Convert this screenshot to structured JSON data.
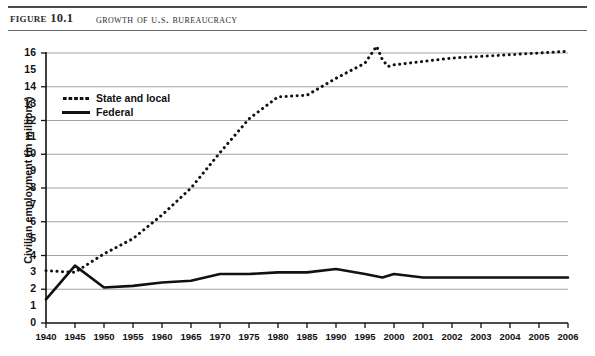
{
  "header": {
    "figure_number": "Figure 10.1",
    "title": "Growth of U.S. Bureaucracy"
  },
  "chart_data": {
    "type": "line",
    "title": "Growth of U.S. Bureaucracy",
    "xlabel": "",
    "ylabel": "Civilian employment (in millions)",
    "ylim": [
      0,
      16
    ],
    "xlim": [
      1940,
      2006
    ],
    "grid": true,
    "grid_values": [
      2,
      4,
      6,
      8,
      10,
      12,
      14,
      16
    ],
    "legend_position": "top-left",
    "ytick_labels": [
      "0",
      "1",
      "2",
      "3",
      "4",
      "5",
      "6",
      "7",
      "8",
      "9",
      "10",
      "11",
      "12",
      "13",
      "14",
      "15",
      "16"
    ],
    "ytick_values": [
      0,
      1,
      2,
      3,
      4,
      5,
      6,
      7,
      8,
      9,
      10,
      11,
      12,
      13,
      14,
      15,
      16
    ],
    "xtick_labels": [
      "1940",
      "1945",
      "1950",
      "1955",
      "1960",
      "1965",
      "1970",
      "1975",
      "1980",
      "1985",
      "1990",
      "1995",
      "2000",
      "2001",
      "2002",
      "2003",
      "2004",
      "2005",
      "2006"
    ],
    "xtick_values": [
      1940,
      1945,
      1950,
      1955,
      1960,
      1965,
      1970,
      1975,
      1980,
      1985,
      1990,
      1995,
      2000,
      2001,
      2002,
      2003,
      2004,
      2005,
      2006
    ],
    "series": [
      {
        "name": "State and local",
        "style": "dotted",
        "color": "#111111",
        "x": [
          1940,
          1945,
          1950,
          1955,
          1960,
          1965,
          1970,
          1975,
          1980,
          1985,
          1990,
          1995,
          1997,
          1998,
          1999,
          2000,
          2001,
          2002,
          2003,
          2004,
          2005,
          2006
        ],
        "values": [
          3.1,
          3.0,
          4.1,
          5.0,
          6.4,
          8.0,
          10.1,
          12.1,
          13.4,
          13.5,
          14.5,
          15.4,
          16.4,
          15.6,
          15.2,
          15.3,
          15.5,
          15.7,
          15.8,
          15.9,
          16.0,
          16.1
        ]
      },
      {
        "name": "Federal",
        "style": "solid",
        "color": "#111111",
        "x": [
          1940,
          1945,
          1950,
          1955,
          1960,
          1965,
          1970,
          1975,
          1980,
          1985,
          1990,
          1995,
          1998,
          1999,
          2000,
          2001,
          2002,
          2003,
          2004,
          2005,
          2006
        ],
        "values": [
          1.4,
          3.4,
          2.1,
          2.2,
          2.4,
          2.5,
          2.9,
          2.9,
          3.0,
          3.0,
          3.2,
          2.9,
          2.7,
          2.8,
          2.9,
          2.7,
          2.7,
          2.7,
          2.7,
          2.7,
          2.7
        ]
      }
    ]
  },
  "legend": {
    "items": [
      {
        "label": "State and local",
        "style": "dotted"
      },
      {
        "label": "Federal",
        "style": "solid"
      }
    ]
  }
}
